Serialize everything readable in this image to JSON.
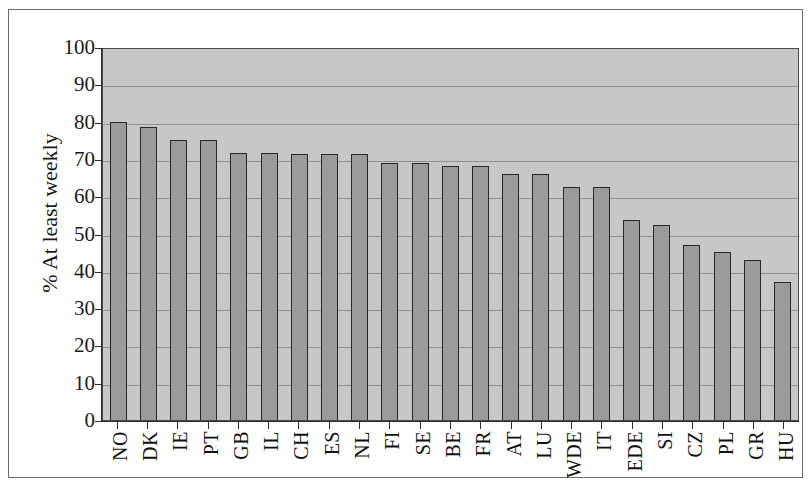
{
  "chart_data": {
    "type": "bar",
    "title": "",
    "xlabel": "",
    "ylabel": "% At least weekly",
    "ylim": [
      0,
      100
    ],
    "ytick_step": 10,
    "yticks": [
      100,
      90,
      80,
      70,
      60,
      50,
      40,
      30,
      20,
      10,
      0
    ],
    "grid": true,
    "legend": "none",
    "bar_fill_color": "#9b9b9b",
    "bar_edge_color": "#272727",
    "plot_background_color": "#c7c7c7",
    "categories": [
      "NO",
      "DK",
      "IE",
      "PT",
      "GB",
      "IL",
      "CH",
      "ES",
      "NL",
      "FI",
      "SE",
      "BE",
      "FR",
      "AT",
      "LU",
      "WDE",
      "IT",
      "EDE",
      "SI",
      "CZ",
      "PL",
      "GR",
      "HU"
    ],
    "values": [
      80.0,
      78.5,
      75.0,
      75.0,
      71.7,
      71.7,
      71.2,
      71.2,
      71.2,
      69.0,
      69.0,
      68.0,
      68.0,
      66.0,
      66.0,
      62.5,
      62.5,
      53.5,
      52.3,
      47.0,
      45.0,
      43.0,
      37.0
    ]
  },
  "figure": {
    "title_remnant": "cropped title line"
  }
}
